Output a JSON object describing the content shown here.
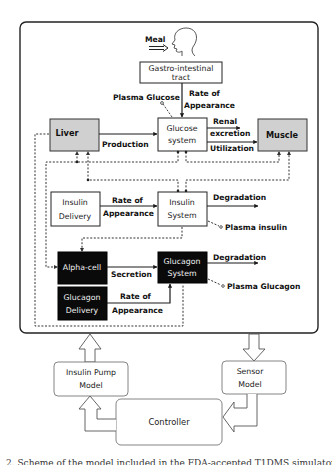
{
  "diagram": {
    "input": {
      "meal_label": "Meal",
      "icon": "human-head-icon"
    },
    "boxes": {
      "gi_tract": {
        "line1": "Gastro-intestinal",
        "line2": "tract"
      },
      "glucose_system": {
        "line1": "Glucose",
        "line2": "system"
      },
      "liver": {
        "label": "Liver"
      },
      "muscle": {
        "label": "Muscle"
      },
      "insulin_delivery": {
        "line1": "Insulin",
        "line2": "Delivery"
      },
      "insulin_system": {
        "line1": "Insulin",
        "line2": "System"
      },
      "alpha_cell": {
        "label": "Alpha-cell"
      },
      "glucagon_system": {
        "line1": "Glucagon",
        "line2": "System"
      },
      "glucagon_delivery": {
        "line1": "Glucagon",
        "line2": "Delivery"
      },
      "insulin_pump_model": {
        "line1": "Insulin Pump",
        "line2": "Model"
      },
      "sensor_model": {
        "line1": "Sensor",
        "line2": "Model"
      },
      "controller": {
        "label": "Controller"
      }
    },
    "edge_labels": {
      "plasma_glucose": "Plasma Glucose",
      "gi_rate_line1": "Rate of",
      "gi_rate_line2": "Appearance",
      "production": "Production",
      "renal_line1": "Renal",
      "renal_line2": "excretion",
      "utilization": "Utilization",
      "insulin_rate_line1": "Rate of",
      "insulin_rate_line2": "Appearance",
      "insulin_degradation": "Degradation",
      "plasma_insulin": "Plasma insulin",
      "secretion": "Secretion",
      "glucagon_degradation": "Degradation",
      "plasma_glucagon": "Plasma Glucagon",
      "glucagon_rate_line1": "Rate of",
      "glucagon_rate_line2": "Appearance"
    },
    "colors": {
      "organ_fill": "#d0d0d0",
      "black_box_fill": "#0a0a0a",
      "line": "#1a1a1a",
      "soft_box_stroke": "#777777"
    }
  },
  "caption": "2. Scheme of the model included in the FDA-accepted T1DMS simulator"
}
